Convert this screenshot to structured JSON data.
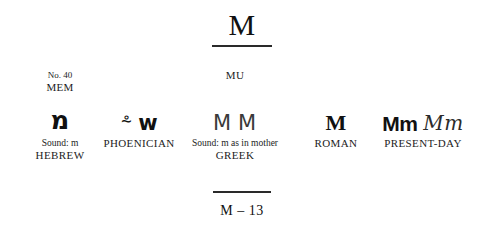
{
  "title": {
    "letter": "M"
  },
  "columns": [
    {
      "id": "hebrew",
      "number_label": "No. 40",
      "letter_name": "MEM",
      "glyphs": [
        "מ"
      ],
      "sound": "Sound: m",
      "system": "HEBREW"
    },
    {
      "id": "phoenician",
      "number_label": "",
      "letter_name": "",
      "glyphs": [
        "⸛",
        "ᴡ"
      ],
      "sound": "",
      "system": "PHOENICIAN"
    },
    {
      "id": "greek",
      "number_label": "",
      "letter_name": "MU",
      "glyphs": [
        "Μ",
        "Μ"
      ],
      "sound": "Sound: m as in mother",
      "system": "GREEK"
    },
    {
      "id": "roman",
      "number_label": "",
      "letter_name": "",
      "glyphs": [
        "M"
      ],
      "sound": "",
      "system": "ROMAN"
    },
    {
      "id": "present-day",
      "number_label": "",
      "letter_name": "",
      "glyphs": [
        "Mm",
        "Mm"
      ],
      "sound": "",
      "system": "PRESENT-DAY"
    }
  ],
  "footer": {
    "page_label": "M – 13"
  },
  "colors": {
    "background": "#ffffff",
    "ink": "#111111",
    "rule": "#2a2a2a"
  }
}
